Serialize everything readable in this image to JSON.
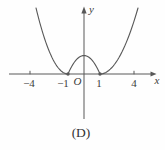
{
  "figure": {
    "caption": "(D)",
    "x_axis_label": "x",
    "y_axis_label": "y",
    "origin_label": "O",
    "tick_labels": {
      "neg4": "−4",
      "neg1": "−1",
      "pos1": "1",
      "pos4": "4"
    }
  },
  "chart_data": {
    "type": "line",
    "title": "(D)",
    "xlabel": "x",
    "ylabel": "y",
    "function": "y = |x^2 - 1|",
    "x_tick_values": [
      -4,
      -1,
      1,
      4
    ],
    "xlim": [
      -4.7,
      4.7
    ],
    "ylim": [
      0,
      8
    ],
    "grid": false,
    "legend": false,
    "key_points": {
      "zeros": [
        [
          -1,
          0
        ],
        [
          1,
          0
        ]
      ],
      "local_max": [
        0,
        1
      ]
    },
    "series": [
      {
        "name": "y = |x^2 - 1|",
        "x": [
          -3,
          -2.5,
          -2,
          -1.5,
          -1,
          -0.5,
          0,
          0.5,
          1,
          1.5,
          2,
          2.5,
          3
        ],
        "y": [
          8,
          5.25,
          3,
          1.25,
          0,
          0.75,
          1,
          0.75,
          0,
          1.25,
          3,
          5.25,
          8
        ]
      }
    ]
  },
  "geometry": {
    "canvas": {
      "w": 165,
      "h": 150
    },
    "colors": {
      "stroke": "#585858",
      "text": "#3c3c3c",
      "background": "#fefefe"
    },
    "x_axis": {
      "x1": 9,
      "x2": 152,
      "y": 74,
      "tip": 156.5
    },
    "y_axis": {
      "x": 84,
      "top": 13,
      "bottom": 119,
      "tip": 6.5
    },
    "tick_marks": [
      30,
      134
    ],
    "tick_y1": 70.8,
    "tick_y2": 74.3,
    "curve_segments": [
      {
        "name": "curve-left-arm",
        "x0": 36,
        "x1": 68,
        "vx": 68,
        "vy": 74,
        "k": -0.0645
      },
      {
        "name": "curve-middle-hump",
        "x0": 68,
        "x1": 100,
        "vx": 84,
        "vy": 55.5,
        "k": 0.07227
      },
      {
        "name": "curve-right-arm",
        "x0": 100,
        "x1": 138,
        "vx": 100,
        "vy": 74,
        "k": -0.0457
      }
    ],
    "touch_points": [
      {
        "x": 68,
        "y": 74
      },
      {
        "x": 100,
        "y": 74
      }
    ],
    "dot_radius": 1.7
  }
}
